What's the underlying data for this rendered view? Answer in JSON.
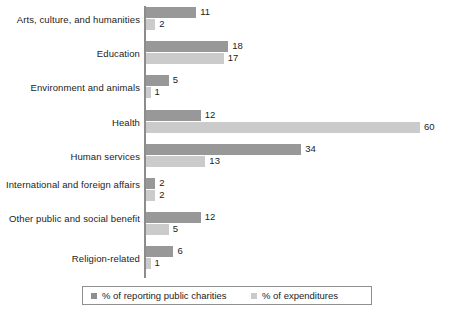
{
  "chart_data": {
    "type": "bar",
    "orientation": "horizontal",
    "title": "",
    "subtitle": "",
    "xlabel": "",
    "ylabel": "",
    "xlim": [
      0,
      60
    ],
    "grid": false,
    "legend_position": "bottom",
    "categories": [
      "Arts, culture, and humanities",
      "Education",
      "Environment and animals",
      "Health",
      "Human services",
      "International and foreign affairs",
      "Other public and social benefit",
      "Religion-related"
    ],
    "series": [
      {
        "name": "% of reporting public charities",
        "color": "#989898",
        "values": [
          11,
          18,
          5,
          12,
          34,
          2,
          12,
          6
        ]
      },
      {
        "name": "% of expenditures",
        "color": "#cbcbcb",
        "values": [
          2,
          17,
          1,
          60,
          13,
          2,
          5,
          1
        ]
      }
    ]
  },
  "legend": {
    "entries": [
      {
        "label": "% of reporting public charities",
        "color": "#8e8e8e"
      },
      {
        "label": "% of expenditures",
        "color": "#cbcbcb"
      }
    ]
  },
  "colors": {
    "series_dark": "#989898",
    "series_light": "#cbcbcb",
    "axis": "#8c8c8c",
    "text": "#1c1c1c",
    "background": "#ffffff"
  }
}
